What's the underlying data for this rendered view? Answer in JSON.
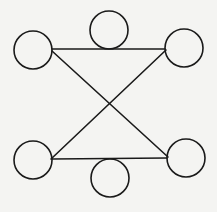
{
  "diagram": {
    "background": "#f4f4f2",
    "stroke_color": "#1a1a1a",
    "stroke_width": 1.6,
    "nodes": [
      {
        "id": "top-left",
        "cx": 33,
        "cy": 50,
        "r": 19
      },
      {
        "id": "top-center",
        "cx": 109,
        "cy": 30,
        "r": 19
      },
      {
        "id": "top-right",
        "cx": 184,
        "cy": 48,
        "r": 19
      },
      {
        "id": "bottom-left",
        "cx": 33,
        "cy": 160,
        "r": 19
      },
      {
        "id": "bottom-center",
        "cx": 110,
        "cy": 178,
        "r": 19
      },
      {
        "id": "bottom-right",
        "cx": 186,
        "cy": 158,
        "r": 19
      }
    ],
    "edges": [
      {
        "id": "top-edge",
        "x1": 52,
        "y1": 49,
        "x2": 165,
        "y2": 49
      },
      {
        "id": "bottom-edge",
        "x1": 52,
        "y1": 159,
        "x2": 167,
        "y2": 158
      },
      {
        "id": "diagonal-tl-br",
        "x1": 52,
        "y1": 51,
        "x2": 168,
        "y2": 157
      },
      {
        "id": "diagonal-tr-bl",
        "x1": 166,
        "y1": 50,
        "x2": 51,
        "y2": 159
      }
    ]
  }
}
